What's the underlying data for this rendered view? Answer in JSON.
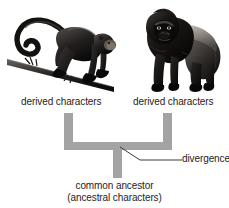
{
  "figure": {
    "background_color": "#ffffff",
    "branch_color": "#a3a3a3",
    "line_color": "#3a3a3a",
    "text_color": "#1d1d1d"
  },
  "organisms": [
    {
      "id": "monkey",
      "icon": "spider-monkey-on-branch-illustration",
      "label": "derived characters"
    },
    {
      "id": "gorilla",
      "icon": "silverback-gorilla-illustration",
      "label": "derived characters"
    }
  ],
  "annotations": {
    "divergence": "divergence",
    "common_ancestor_line1": "common ancestor",
    "common_ancestor_line2": "(ancestral characters)"
  },
  "diagram_data": {
    "type": "cladogram",
    "nodes": [
      {
        "id": "root",
        "label": "common ancestor (ancestral characters)",
        "x": 118,
        "y": 178
      },
      {
        "id": "divergence",
        "label": "divergence",
        "x": 118,
        "y": 146
      },
      {
        "id": "tip-left",
        "label": "derived characters",
        "x": 69,
        "y": 113
      },
      {
        "id": "tip-right",
        "label": "derived characters",
        "x": 167,
        "y": 113
      }
    ],
    "edges": [
      {
        "from": "root",
        "to": "divergence"
      },
      {
        "from": "divergence",
        "to": "tip-left"
      },
      {
        "from": "divergence",
        "to": "tip-right"
      }
    ]
  }
}
